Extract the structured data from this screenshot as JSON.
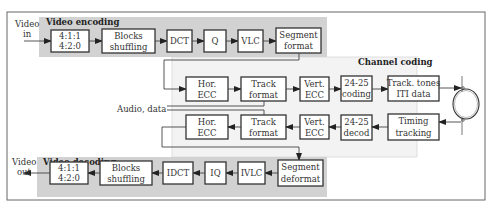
{
  "diagram": {
    "encoding": {
      "title": "Video encoding",
      "input_label_1": "Video",
      "input_label_2": "in",
      "blocks": [
        {
          "l1": "4:1:1",
          "l2": "4:2:0"
        },
        {
          "l1": "Blocks",
          "l2": "shuffling"
        },
        {
          "l1": "DCT",
          "l2": ""
        },
        {
          "l1": "Q",
          "l2": ""
        },
        {
          "l1": "VLC",
          "l2": ""
        },
        {
          "l1": "Segment",
          "l2": "format"
        }
      ]
    },
    "channel": {
      "title": "Channel coding",
      "side_input": "Audio, data",
      "record_path": [
        {
          "l1": "Hor.",
          "l2": "ECC"
        },
        {
          "l1": "Track",
          "l2": "format"
        },
        {
          "l1": "Vert.",
          "l2": "ECC"
        },
        {
          "l1": "24-25",
          "l2": "coding"
        },
        {
          "l1": "Track. tones",
          "l2": "ITI data"
        }
      ],
      "playback_path": [
        {
          "l1": "Hor.",
          "l2": "ECC"
        },
        {
          "l1": "Track",
          "l2": "format"
        },
        {
          "l1": "Vert.",
          "l2": "ECC"
        },
        {
          "l1": "24-25",
          "l2": "decod"
        },
        {
          "l1": "Timing",
          "l2": "tracking"
        }
      ],
      "head_drum": "tape-drum-icon"
    },
    "decoding": {
      "title": "Video decoding",
      "output_label_1": "Video",
      "output_label_2": "out",
      "blocks": [
        {
          "l1": "4:1:1",
          "l2": "4:2:0"
        },
        {
          "l1": "Blocks",
          "l2": "shuffling"
        },
        {
          "l1": "IDCT",
          "l2": ""
        },
        {
          "l1": "IQ",
          "l2": ""
        },
        {
          "l1": "IVLC",
          "l2": ""
        },
        {
          "l1": "Segment",
          "l2": "deformat"
        }
      ]
    },
    "colors": {
      "encoding_panel": "#d2d2d2",
      "channel_panel": "#f3f3f3",
      "box_border": "#333333"
    }
  }
}
